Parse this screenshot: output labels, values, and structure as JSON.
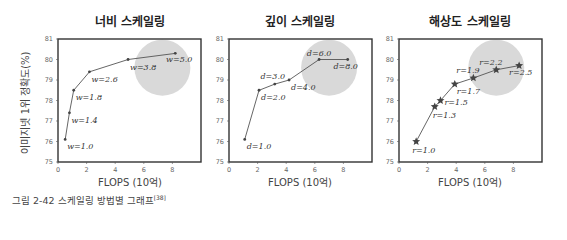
{
  "caption": {
    "text": "그림 2-42 스케일링 방법별 그래프",
    "ref": "[38]"
  },
  "ylabel": "이미지넷 1위 정확도(%)",
  "chart_data": [
    {
      "type": "line",
      "title": "너비 스케일링",
      "xlabel": "FLOPS (10억)",
      "ylabel": "이미지넷 1위 정확도(%)",
      "xlim": [
        0,
        10
      ],
      "ylim": [
        75,
        81
      ],
      "xticks": [
        0,
        2,
        4,
        6,
        8
      ],
      "yticks": [
        75,
        76,
        77,
        78,
        79,
        80,
        81
      ],
      "grid": false,
      "marker": "dot",
      "points": [
        {
          "label": "w=1.0",
          "x": 0.5,
          "y": 76.1
        },
        {
          "label": "w=1.4",
          "x": 0.8,
          "y": 77.4
        },
        {
          "label": "w=1.8",
          "x": 1.1,
          "y": 78.5
        },
        {
          "label": "w=2.6",
          "x": 2.2,
          "y": 79.4
        },
        {
          "label": "w=3.8",
          "x": 4.9,
          "y": 80.0
        },
        {
          "label": "w=5.0",
          "x": 8.2,
          "y": 80.3
        }
      ],
      "highlight_circle": {
        "cx": 7.3,
        "cy": 79.6,
        "r_px": 28
      }
    },
    {
      "type": "line",
      "title": "깊이 스케일링",
      "xlabel": "FLOPS (10억)",
      "xlim": [
        0,
        10
      ],
      "ylim": [
        75,
        81
      ],
      "xticks": [
        0,
        2,
        4,
        6,
        8
      ],
      "yticks": [
        75,
        76,
        77,
        78,
        79,
        80,
        81
      ],
      "grid": false,
      "marker": "dot",
      "points": [
        {
          "label": "d=1.0",
          "x": 1.1,
          "y": 76.1
        },
        {
          "label": "d=2.0",
          "x": 2.1,
          "y": 78.5
        },
        {
          "label": "d=3.0",
          "x": 3.2,
          "y": 78.8
        },
        {
          "label": "d=4.0",
          "x": 4.2,
          "y": 79.0
        },
        {
          "label": "d=6.0",
          "x": 6.3,
          "y": 80.0
        },
        {
          "label": "d=8.0",
          "x": 8.3,
          "y": 80.0
        }
      ],
      "highlight_circle": {
        "cx": 7.0,
        "cy": 79.6,
        "r_px": 28
      }
    },
    {
      "type": "line",
      "title": "해상도 스케일링",
      "xlabel": "FLOPS (10억)",
      "xlim": [
        0,
        10
      ],
      "ylim": [
        75,
        81
      ],
      "xticks": [
        0,
        2,
        4,
        6,
        8
      ],
      "yticks": [
        75,
        76,
        77,
        78,
        79,
        80,
        81
      ],
      "grid": false,
      "marker": "star",
      "points": [
        {
          "label": "r=1.0",
          "x": 1.2,
          "y": 76.0
        },
        {
          "label": "r=1.3",
          "x": 2.5,
          "y": 77.7
        },
        {
          "label": "r=1.5",
          "x": 2.9,
          "y": 78.0
        },
        {
          "label": "r=1.7",
          "x": 3.9,
          "y": 78.8
        },
        {
          "label": "r=1.9",
          "x": 5.2,
          "y": 79.1
        },
        {
          "label": "r=2.2",
          "x": 6.8,
          "y": 79.5
        },
        {
          "label": "r=2.5",
          "x": 8.4,
          "y": 79.7
        }
      ],
      "highlight_circle": {
        "cx": 6.8,
        "cy": 79.6,
        "r_px": 28
      }
    }
  ]
}
